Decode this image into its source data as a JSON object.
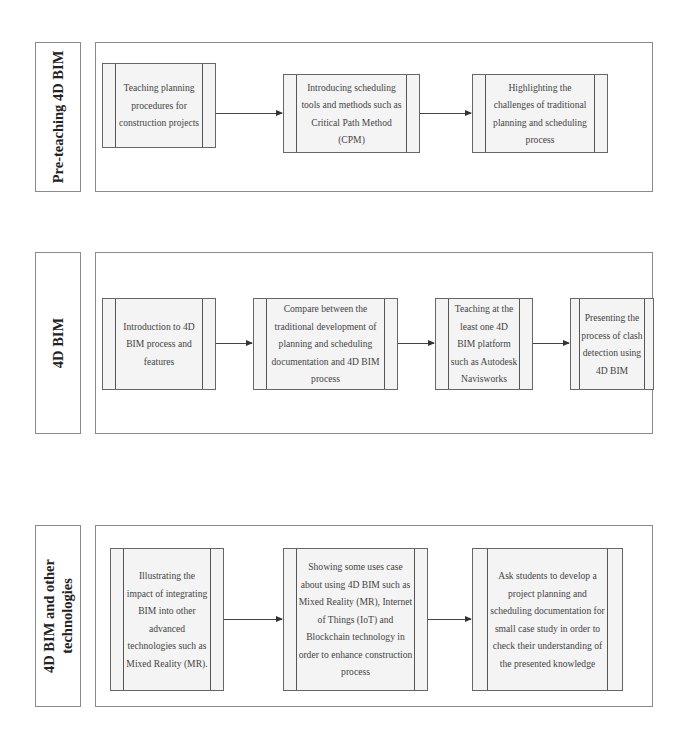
{
  "diagram": {
    "type": "process-flow",
    "sections": [
      {
        "label": "Pre-teaching 4D BIM",
        "steps": [
          "Teaching planning procedures for construction projects",
          "Introducing scheduling tools and methods such as Critical Path Method (CPM)",
          "Highlighting the challenges of traditional planning and scheduling process"
        ]
      },
      {
        "label": "4D BIM",
        "steps": [
          "Introduction to 4D BIM process and features",
          "Compare between the traditional development of planning and scheduling documentation and 4D BIM process",
          "Teaching at the least one 4D BIM platform such as Autodesk Navisworks",
          "Presenting the process of clash detection using 4D BIM"
        ]
      },
      {
        "label": "4D BIM and other technologies",
        "steps": [
          "Illustrating the impact of integrating BIM into other advanced technologies such as Mixed Reality (MR).",
          "Showing some uses case about using 4D BIM such as Mixed Reality (MR), Internet of Things (IoT) and Blockchain technology in order to enhance construction process",
          "Ask students to develop a project planning and scheduling documentation for small case study in order to check their understanding of the presented knowledge"
        ]
      }
    ],
    "colors": {
      "border": "#8a8a8a",
      "process_fill": "#f4f4f4",
      "text": "#444444",
      "arrow": "#444444"
    }
  }
}
